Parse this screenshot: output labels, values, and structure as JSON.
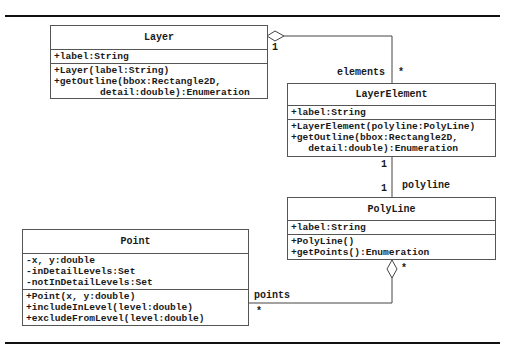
{
  "diagram": {
    "type": "UML class diagram",
    "classes": [
      {
        "name": "Layer",
        "attributes": [
          "+label:String"
        ],
        "operations": [
          "+Layer(label:String)",
          "+getOutline(bbox:Rectangle2D,",
          "        detail:double):Enumeration"
        ]
      },
      {
        "name": "LayerElement",
        "attributes": [
          "+label:String"
        ],
        "operations": [
          "+LayerElement(polyline:PolyLine)",
          "+getOutline(bbox:Rectangle2D,",
          "   detail:double):Enumeration"
        ]
      },
      {
        "name": "PolyLine",
        "attributes": [
          "+label:String"
        ],
        "operations": [
          "+PolyLine()",
          "+getPoints():Enumeration"
        ]
      },
      {
        "name": "Point",
        "attributes": [
          "-x, y:double",
          "-inDetailLevels:Set",
          "-notInDetailLevels:Set"
        ],
        "operations": [
          "+Point(x, y:double)",
          "+includeInLevel(level:double)",
          "+excludeFromLevel(level:double)"
        ]
      }
    ],
    "associations": [
      {
        "from": "Layer",
        "to": "LayerElement",
        "kind": "aggregation",
        "from_mult": "1",
        "to_mult": "*",
        "role": "elements"
      },
      {
        "from": "LayerElement",
        "to": "PolyLine",
        "kind": "association",
        "from_mult": "1",
        "to_mult": "1",
        "role": "polyline"
      },
      {
        "from": "PolyLine",
        "to": "Point",
        "kind": "aggregation",
        "from_mult": "*",
        "to_mult": "*",
        "role": "points"
      }
    ]
  },
  "labels": {
    "layer_mult": "1",
    "elements_role": "elements",
    "elements_mult": "*",
    "le_mult": "1",
    "poly_mult": "1",
    "polyline_role": "polyline",
    "poly_agg_mult": "*",
    "points_role": "points",
    "points_mult": "*"
  }
}
